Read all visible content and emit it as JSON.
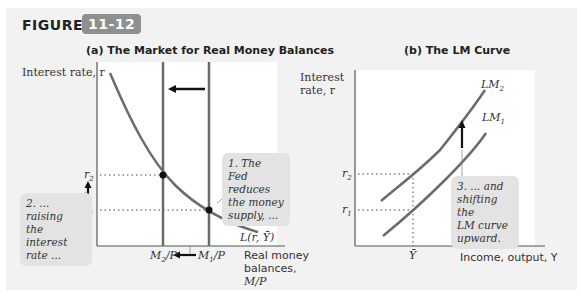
{
  "figure": {
    "label": "FIGURE",
    "number": "11-12"
  },
  "panel_a": {
    "title": "(a) The Market for Real Money Balances",
    "ylabel": "Interest rate, r",
    "xlabel_lines": [
      "Real money",
      "balances,",
      "M/P"
    ],
    "ticks": {
      "r2": "r",
      "r2_sub": "2",
      "r1": "r",
      "r1_sub": "1",
      "m2": "M",
      "m2_sub": "2",
      "m2_suffix": "/P",
      "m1": "M",
      "m1_sub": "1",
      "m1_suffix": "/P"
    },
    "curve_label": "L(r, Ȳ)",
    "note1": [
      "1. The Fed",
      "reduces",
      "the money",
      "supply, ..."
    ],
    "note2": [
      "2. ...",
      "raising",
      "the interest",
      "rate ..."
    ]
  },
  "panel_b": {
    "title": "(b) The LM Curve",
    "ylabel_lines": [
      "Interest",
      "rate, r"
    ],
    "xlabel": "Income, output, Y",
    "ticks": {
      "r2": "r",
      "r2_sub": "2",
      "r1": "r",
      "r1_sub": "1",
      "ybar": "Ȳ"
    },
    "curve_lm2": "LM",
    "curve_lm2_sub": "2",
    "curve_lm1": "LM",
    "curve_lm1_sub": "1",
    "note3": [
      "3. ... and",
      "shifting the",
      "LM curve",
      "upward."
    ]
  },
  "colors": {
    "curve": "#6b6b6b",
    "axis": "#555555",
    "panel_bg": "#f2f2f2",
    "plot_bg": "#ffffff",
    "badge": "#8f8f8f",
    "note_bg": "#e3e3e3"
  }
}
